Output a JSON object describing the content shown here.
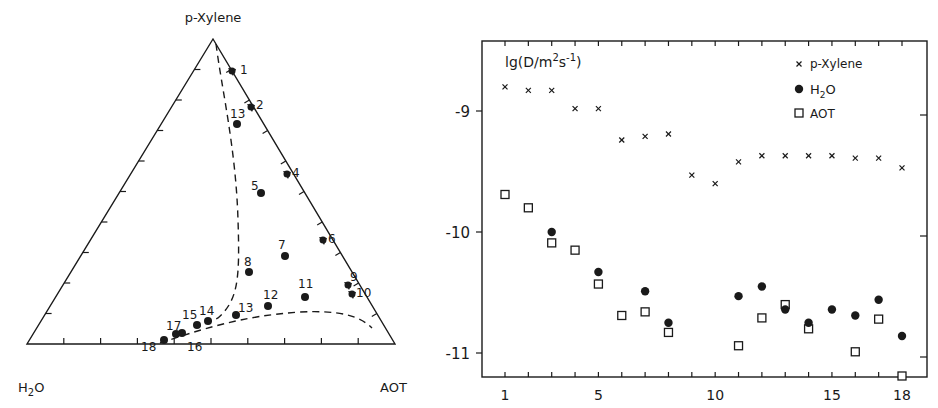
{
  "chart_data": [
    {
      "type": "ternary",
      "title": "",
      "vertices": {
        "top": "p-Xylene",
        "bottom_left": "H2O",
        "bottom_right": "AOT"
      },
      "vertex_labels": {
        "top": "p-Xylene",
        "bottom_left_main": "H",
        "bottom_left_sub": "2",
        "bottom_left_tail": "O",
        "bottom_right": "AOT"
      },
      "points": [
        {
          "id": "1",
          "x": 232,
          "y": 71,
          "on_edge": true
        },
        {
          "id": "2",
          "x": 251,
          "y": 107,
          "on_edge": true
        },
        {
          "id": "3",
          "x": 237,
          "y": 124,
          "on_edge": false
        },
        {
          "id": "4",
          "x": 287,
          "y": 174,
          "on_edge": true
        },
        {
          "id": "5",
          "x": 261,
          "y": 193,
          "on_edge": false
        },
        {
          "id": "6",
          "x": 323,
          "y": 240,
          "on_edge": true
        },
        {
          "id": "7",
          "x": 285,
          "y": 256,
          "on_edge": false
        },
        {
          "id": "8",
          "x": 249,
          "y": 272,
          "on_edge": false
        },
        {
          "id": "9",
          "x": 348,
          "y": 285,
          "on_edge": true
        },
        {
          "id": "10",
          "x": 352,
          "y": 294,
          "on_edge": true
        },
        {
          "id": "11",
          "x": 305,
          "y": 297,
          "on_edge": false
        },
        {
          "id": "12",
          "x": 268,
          "y": 306,
          "on_edge": false
        },
        {
          "id": "13",
          "x": 236,
          "y": 315,
          "on_edge": false
        },
        {
          "id": "14",
          "x": 208,
          "y": 321,
          "on_edge": false
        },
        {
          "id": "15",
          "x": 197,
          "y": 325,
          "on_edge": false
        },
        {
          "id": "16",
          "x": 182,
          "y": 333,
          "on_edge": false
        },
        {
          "id": "17",
          "x": 176,
          "y": 334,
          "on_edge": false
        },
        {
          "id": "18",
          "x": 164,
          "y": 340,
          "on_edge": false
        }
      ],
      "point_labels": [
        {
          "text": "1",
          "x": 240,
          "y": 74
        },
        {
          "text": "2",
          "x": 256,
          "y": 109
        },
        {
          "text": "13",
          "x": 230,
          "y": 118
        },
        {
          "text": "4",
          "x": 292,
          "y": 177
        },
        {
          "text": "5",
          "x": 251,
          "y": 190
        },
        {
          "text": "6",
          "x": 328,
          "y": 243
        },
        {
          "text": "7",
          "x": 278,
          "y": 249
        },
        {
          "text": "8",
          "x": 244,
          "y": 266
        },
        {
          "text": "9",
          "x": 350,
          "y": 281
        },
        {
          "text": "10",
          "x": 356,
          "y": 297
        },
        {
          "text": "11",
          "x": 298,
          "y": 288
        },
        {
          "text": "12",
          "x": 263,
          "y": 299
        },
        {
          "text": "13",
          "x": 238,
          "y": 312
        },
        {
          "text": "14",
          "x": 199,
          "y": 315
        },
        {
          "text": "15",
          "x": 182,
          "y": 319
        },
        {
          "text": "16",
          "x": 187,
          "y": 351
        },
        {
          "text": "17",
          "x": 166,
          "y": 330
        },
        {
          "text": "18",
          "x": 141,
          "y": 351
        }
      ],
      "phase_boundary": "dashed curve from p-Xylene apex down near points 3 and 8, curving to points 14-18, then rising along points 13 and sweeping right to the AOT edge",
      "ticks_per_edge": 9
    },
    {
      "type": "scatter",
      "title": "",
      "ylabel": "lg(D/m2s-1)",
      "ylabel_parts": {
        "pre": "lg(D/m",
        "sup1": "2",
        "mid": "s",
        "sup2": "-1",
        "post": ")"
      },
      "xlabel": "",
      "xlim": [
        0,
        19
      ],
      "ylim": [
        -11.2,
        -8.4
      ],
      "x_tick_labels": [
        "1",
        "5",
        "10",
        "15",
        "18"
      ],
      "x_tick_values": [
        1,
        5,
        10,
        15,
        18
      ],
      "y_tick_labels": [
        "-9",
        "-10",
        "-11"
      ],
      "y_tick_values": [
        -9,
        -10,
        -11
      ],
      "grid": false,
      "legend_position": "upper right inside",
      "legend": [
        {
          "marker": "x",
          "name": "p-Xylene"
        },
        {
          "marker": "filled-circle",
          "name_main": "H",
          "name_sub": "2",
          "name_tail": "O",
          "name": "H2O"
        },
        {
          "marker": "open-square",
          "name": "AOT"
        }
      ],
      "series": [
        {
          "name": "p-Xylene",
          "marker": "x",
          "x": [
            1,
            2,
            3,
            4,
            5,
            6,
            7,
            8,
            9,
            10,
            11,
            12,
            13,
            14,
            15,
            16,
            17,
            18
          ],
          "y": [
            -8.8,
            -8.83,
            -8.83,
            -8.98,
            -8.98,
            -9.24,
            -9.21,
            -9.19,
            -9.53,
            -9.6,
            -9.42,
            -9.37,
            -9.37,
            -9.37,
            -9.37,
            -9.39,
            -9.39,
            -9.47
          ]
        },
        {
          "name": "H2O",
          "marker": "filled-circle",
          "x": [
            3,
            5,
            7,
            8,
            11,
            12,
            13,
            14,
            15,
            16,
            17,
            18
          ],
          "y": [
            -10.0,
            -10.33,
            -10.49,
            -10.75,
            -10.53,
            -10.45,
            -10.64,
            -10.75,
            -10.64,
            -10.69,
            -10.56,
            -10.86
          ]
        },
        {
          "name": "AOT",
          "marker": "open-square",
          "x": [
            1,
            2,
            3,
            4,
            5,
            6,
            7,
            8,
            11,
            12,
            13,
            14,
            16,
            17,
            18
          ],
          "y": [
            -9.69,
            -9.8,
            -10.09,
            -10.15,
            -10.43,
            -10.69,
            -10.66,
            -10.83,
            -10.94,
            -10.71,
            -10.6,
            -10.8,
            -10.99,
            -10.72,
            -11.19
          ]
        }
      ]
    }
  ]
}
